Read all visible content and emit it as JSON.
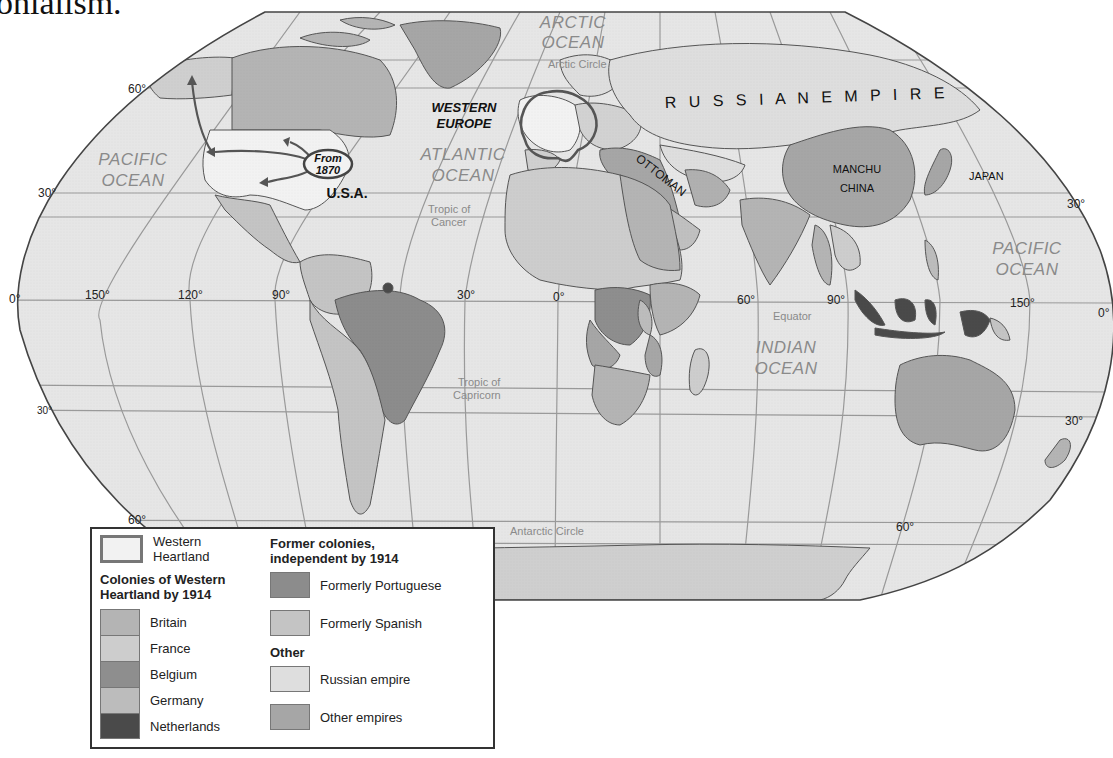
{
  "page": {
    "heading_fragment": "onialism."
  },
  "map": {
    "title": "Western Heartland colonies by 1914",
    "colors": {
      "ocean": "#e6e6e6",
      "graticule": "#9a9a9a",
      "outline": "#333333",
      "western_heartland": "#f2f2f2",
      "britain": "#b4b4b4",
      "france": "#cdcdcd",
      "belgium": "#8e8e8e",
      "germany": "#bcbcbc",
      "netherlands": "#4a4a4a",
      "formerly_portuguese": "#8c8c8c",
      "formerly_spanish": "#c4c4c4",
      "russian_empire": "#dedede",
      "other_empires": "#a6a6a6",
      "arrow": "#555555"
    },
    "oceans": [
      {
        "name": "arctic",
        "line1": "ARCTIC",
        "line2": "OCEAN"
      },
      {
        "name": "pacific-west",
        "line1": "PACIFIC",
        "line2": "OCEAN"
      },
      {
        "name": "atlantic",
        "line1": "ATLANTIC",
        "line2": "OCEAN"
      },
      {
        "name": "pacific-east",
        "line1": "PACIFIC",
        "line2": "OCEAN"
      },
      {
        "name": "indian",
        "line1": "INDIAN",
        "line2": "OCEAN"
      }
    ],
    "lines": {
      "arctic_circle": "Arctic Circle",
      "tropic_cancer_1": "Tropic of",
      "tropic_cancer_2": "Cancer",
      "equator": "Equator",
      "tropic_capricorn_1": "Tropic of",
      "tropic_capricorn_2": "Capricorn",
      "antarctic_circle": "Antarctic Circle"
    },
    "degrees": {
      "lat_60_w": "60°",
      "lat_30_w": "30°",
      "lat_0_w": "0°",
      "lat_m30_w": "30°",
      "lat_m60_w": "60°",
      "lat_30_e": "30°",
      "lat_0_e": "0°",
      "lat_m30_e": "30°",
      "lat_m60_e": "60°",
      "lon_150w": "150°",
      "lon_120w": "120°",
      "lon_90w": "90°",
      "lon_30w": "30°",
      "lon_0": "0°",
      "lon_60e": "60°",
      "lon_90e": "90°",
      "lon_150e": "150°"
    },
    "regions": {
      "western_europe_1": "WESTERN",
      "western_europe_2": "EUROPE",
      "from_1": "From",
      "from_2": "1870",
      "usa": "U.S.A.",
      "russian_empire": "R U S S I A N   E M P I R E",
      "ottoman": "OTTOMAN",
      "manchu_1": "MANCHU",
      "manchu_2": "CHINA",
      "japan": "JAPAN"
    }
  },
  "legend": {
    "western_heartland": {
      "label_1": "Western",
      "label_2": "Heartland"
    },
    "colonies_header_1": "Colonies of Western",
    "colonies_header_2": "Heartland by 1914",
    "colonies": [
      {
        "label": "Britain",
        "color": "#b4b4b4"
      },
      {
        "label": "France",
        "color": "#cdcdcd"
      },
      {
        "label": "Belgium",
        "color": "#8e8e8e"
      },
      {
        "label": "Germany",
        "color": "#bcbcbc"
      },
      {
        "label": "Netherlands",
        "color": "#4a4a4a"
      }
    ],
    "former_header_1": "Former colonies,",
    "former_header_2": "independent by 1914",
    "former": [
      {
        "label": "Formerly Portuguese",
        "color": "#8c8c8c"
      },
      {
        "label": "Formerly Spanish",
        "color": "#c4c4c4"
      }
    ],
    "other_header": "Other",
    "other": [
      {
        "label": "Russian empire",
        "color": "#dedede"
      },
      {
        "label": "Other empires",
        "color": "#a6a6a6"
      }
    ]
  }
}
